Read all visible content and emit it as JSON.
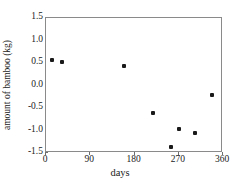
{
  "chart_data": {
    "type": "scatter",
    "title": "",
    "xlabel": "days",
    "ylabel": "amount of bamboo (kg)",
    "xlim": [
      0,
      360
    ],
    "ylim": [
      -1.5,
      1.5
    ],
    "xticks": [
      0,
      90,
      180,
      270,
      360
    ],
    "xtick_labels": [
      "0",
      "90",
      "180",
      "270",
      "360"
    ],
    "yticks": [
      1.5,
      1.0,
      0.5,
      0.0,
      -0.5,
      -1.0,
      -1.5
    ],
    "ytick_labels": [
      "1.5",
      "1.0",
      "0.5",
      "0.0",
      "-0.5",
      "-1.0",
      "-1.5"
    ],
    "grid": false,
    "legend": null,
    "marker_color": "#1a1a1a",
    "marker": "square",
    "series": [
      {
        "name": "amount of bamboo",
        "points": [
          {
            "x": 13,
            "y": 0.57
          },
          {
            "x": 33,
            "y": 0.52
          },
          {
            "x": 159,
            "y": 0.43
          },
          {
            "x": 218,
            "y": -0.62
          },
          {
            "x": 254,
            "y": -1.37
          },
          {
            "x": 270,
            "y": -0.96
          },
          {
            "x": 303,
            "y": -1.05
          },
          {
            "x": 338,
            "y": -0.2
          }
        ]
      }
    ]
  }
}
